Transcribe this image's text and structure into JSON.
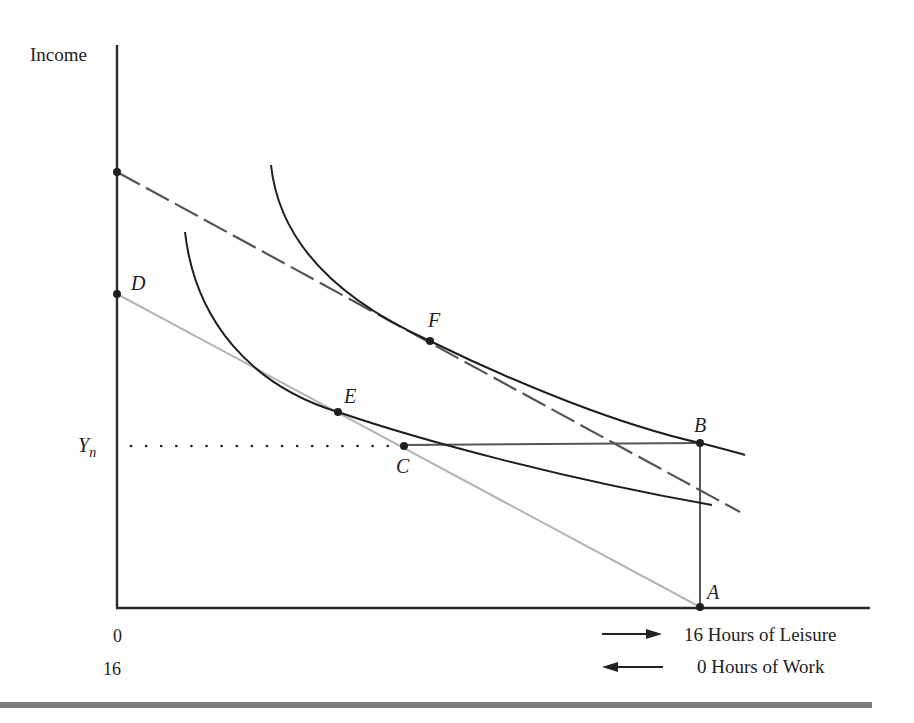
{
  "figure": {
    "y_axis_label": "Income",
    "income_level_label": "Y",
    "income_level_subscript": "n",
    "x_axis_ticks": {
      "leisure_start": "0",
      "work_start": "16"
    },
    "legend": [
      {
        "direction": "right",
        "icon": "arrow-right-icon",
        "text": "16 Hours of Leisure"
      },
      {
        "direction": "left",
        "icon": "arrow-left-icon",
        "text": "0 Hours of Work"
      }
    ],
    "points": {
      "A": "A",
      "B": "B",
      "C": "C",
      "D": "D",
      "E": "E",
      "F": "F"
    },
    "elements": {
      "dashed_budget_line": {
        "style": "dashed",
        "color": "#555555",
        "from": [
          117,
          172
        ],
        "to": [
          740,
          512
        ]
      },
      "gray_budget_line": {
        "style": "solid",
        "color": "#b5b5b5",
        "from": [
          117,
          294
        ],
        "to": [
          700,
          607
        ]
      },
      "lower_indifference_curve": {
        "passes_through": [
          "E"
        ],
        "color": "#1e1e1e"
      },
      "upper_indifference_curve": {
        "passes_through": [
          "F",
          "B"
        ],
        "color": "#1e1e1e"
      },
      "welfare_segment": {
        "from": "C",
        "to": "B",
        "color": "#555555"
      },
      "vertical_segment": {
        "from": "B",
        "to": "A",
        "color": "#555555"
      },
      "dotted_guideline": {
        "level": "Y_n",
        "style": "dotted"
      }
    },
    "colors": {
      "axis": "#2a2a2a",
      "curve": "#1e1e1e",
      "dashed_line": "#555555",
      "gray_line": "#b5b5b5",
      "rule": "#7a7a7a"
    }
  }
}
